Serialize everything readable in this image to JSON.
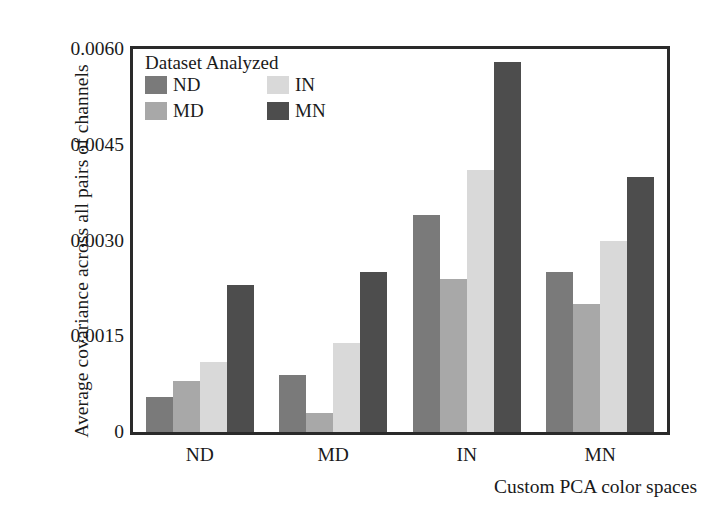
{
  "chart_data": {
    "type": "bar",
    "title": "",
    "xlabel": "Custom PCA color spaces",
    "ylabel": "Average covariance across all pairs of channels",
    "categories": [
      "ND",
      "MD",
      "IN",
      "MN"
    ],
    "series": [
      {
        "name": "ND",
        "color": "#7a7a7a",
        "values": [
          0.00055,
          0.0009,
          0.0034,
          0.0025
        ]
      },
      {
        "name": "MD",
        "color": "#a8a8a8",
        "values": [
          0.0008,
          0.0003,
          0.0024,
          0.002
        ]
      },
      {
        "name": "IN",
        "color": "#d9d9d9",
        "values": [
          0.0011,
          0.0014,
          0.0041,
          0.003
        ]
      },
      {
        "name": "MN",
        "color": "#4d4d4d",
        "values": [
          0.0023,
          0.0025,
          0.0058,
          0.004
        ]
      }
    ],
    "ylim": [
      0,
      0.006
    ],
    "yticks": [
      0,
      0.0015,
      0.003,
      0.0045,
      0.006
    ],
    "ytick_labels": [
      "0",
      "0.0015",
      "0.0030",
      "0.0045",
      "0.0060"
    ],
    "grid": false,
    "legend_position": "upper-left-inside"
  },
  "legend": {
    "title": "Dataset Analyzed",
    "entries": [
      {
        "label": "ND",
        "color": "#7a7a7a"
      },
      {
        "label": "IN",
        "color": "#d9d9d9"
      },
      {
        "label": "MD",
        "color": "#a8a8a8"
      },
      {
        "label": "MN",
        "color": "#4d4d4d"
      }
    ]
  },
  "axes": {
    "frame_color": "#2a2a2a",
    "text_color": "#1a1a1a"
  }
}
